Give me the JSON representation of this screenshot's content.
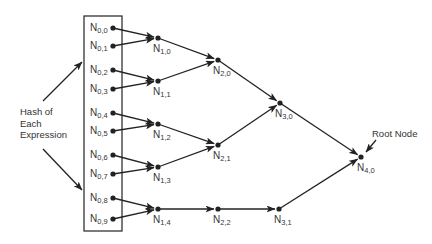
{
  "diagram": {
    "type": "hash-tree",
    "annotations": {
      "hash_label_lines": [
        "Hash of",
        "Each",
        "Expression"
      ],
      "root_label": "Root Node"
    },
    "colors": {
      "stroke": "#222222",
      "text": "#333333",
      "background": "#ffffff"
    },
    "leaf_box": {
      "x": 84,
      "y": 16,
      "w": 38,
      "h": 215
    },
    "nodes": [
      {
        "id": "N0,0",
        "base": "N",
        "sub": "0,0",
        "x": 113,
        "y": 28,
        "lx": 90,
        "ly": 22
      },
      {
        "id": "N0,1",
        "base": "N",
        "sub": "0,1",
        "x": 113,
        "y": 46,
        "lx": 90,
        "ly": 40
      },
      {
        "id": "N0,2",
        "base": "N",
        "sub": "0,2",
        "x": 113,
        "y": 70,
        "lx": 90,
        "ly": 64
      },
      {
        "id": "N0,3",
        "base": "N",
        "sub": "0,3",
        "x": 113,
        "y": 89,
        "lx": 90,
        "ly": 83
      },
      {
        "id": "N0,4",
        "base": "N",
        "sub": "0,4",
        "x": 113,
        "y": 113,
        "lx": 90,
        "ly": 107
      },
      {
        "id": "N0,5",
        "base": "N",
        "sub": "0,5",
        "x": 113,
        "y": 131,
        "lx": 90,
        "ly": 125
      },
      {
        "id": "N0,6",
        "base": "N",
        "sub": "0,6",
        "x": 113,
        "y": 155,
        "lx": 90,
        "ly": 149
      },
      {
        "id": "N0,7",
        "base": "N",
        "sub": "0,7",
        "x": 113,
        "y": 174,
        "lx": 90,
        "ly": 168
      },
      {
        "id": "N0,8",
        "base": "N",
        "sub": "0,8",
        "x": 113,
        "y": 198,
        "lx": 90,
        "ly": 192
      },
      {
        "id": "N0,9",
        "base": "N",
        "sub": "0,9",
        "x": 113,
        "y": 219,
        "lx": 90,
        "ly": 213
      },
      {
        "id": "N1,0",
        "base": "N",
        "sub": "1,0",
        "x": 158,
        "y": 38,
        "lx": 153,
        "ly": 43
      },
      {
        "id": "N1,1",
        "base": "N",
        "sub": "1,1",
        "x": 158,
        "y": 81,
        "lx": 153,
        "ly": 86
      },
      {
        "id": "N1,2",
        "base": "N",
        "sub": "1,2",
        "x": 158,
        "y": 124,
        "lx": 153,
        "ly": 129
      },
      {
        "id": "N1,3",
        "base": "N",
        "sub": "1,3",
        "x": 158,
        "y": 167,
        "lx": 153,
        "ly": 172
      },
      {
        "id": "N1,4",
        "base": "N",
        "sub": "1,4",
        "x": 158,
        "y": 209,
        "lx": 153,
        "ly": 214
      },
      {
        "id": "N2,0",
        "base": "N",
        "sub": "2,0",
        "x": 218,
        "y": 60,
        "lx": 213,
        "ly": 65
      },
      {
        "id": "N2,1",
        "base": "N",
        "sub": "2,1",
        "x": 218,
        "y": 145,
        "lx": 213,
        "ly": 150
      },
      {
        "id": "N2,2",
        "base": "N",
        "sub": "2,2",
        "x": 218,
        "y": 209,
        "lx": 213,
        "ly": 214
      },
      {
        "id": "N3,0",
        "base": "N",
        "sub": "3,0",
        "x": 280,
        "y": 103,
        "lx": 275,
        "ly": 108
      },
      {
        "id": "N3,1",
        "base": "N",
        "sub": "3,1",
        "x": 279,
        "y": 209,
        "lx": 274,
        "ly": 214
      },
      {
        "id": "N4,0",
        "base": "N",
        "sub": "4,0",
        "x": 361,
        "y": 157,
        "lx": 357,
        "ly": 162
      }
    ],
    "edges": [
      [
        "N0,0",
        "N1,0"
      ],
      [
        "N0,1",
        "N1,0"
      ],
      [
        "N0,2",
        "N1,1"
      ],
      [
        "N0,3",
        "N1,1"
      ],
      [
        "N0,4",
        "N1,2"
      ],
      [
        "N0,5",
        "N1,2"
      ],
      [
        "N0,6",
        "N1,3"
      ],
      [
        "N0,7",
        "N1,3"
      ],
      [
        "N0,8",
        "N1,4"
      ],
      [
        "N0,9",
        "N1,4"
      ],
      [
        "N1,0",
        "N2,0"
      ],
      [
        "N1,1",
        "N2,0"
      ],
      [
        "N1,2",
        "N2,1"
      ],
      [
        "N1,3",
        "N2,1"
      ],
      [
        "N1,4",
        "N2,2"
      ],
      [
        "N2,0",
        "N3,0"
      ],
      [
        "N2,1",
        "N3,0"
      ],
      [
        "N2,2",
        "N3,1"
      ],
      [
        "N3,0",
        "N4,0"
      ],
      [
        "N3,1",
        "N4,0"
      ]
    ],
    "pointer_arrows": [
      {
        "name": "hash-arrow-up",
        "x1": 43,
        "y1": 101,
        "x2": 82,
        "y2": 62
      },
      {
        "name": "hash-arrow-down",
        "x1": 43,
        "y1": 149,
        "x2": 82,
        "y2": 190
      },
      {
        "name": "root-arrow",
        "x1": 376,
        "y1": 140,
        "x2": 366,
        "y2": 152
      }
    ]
  }
}
